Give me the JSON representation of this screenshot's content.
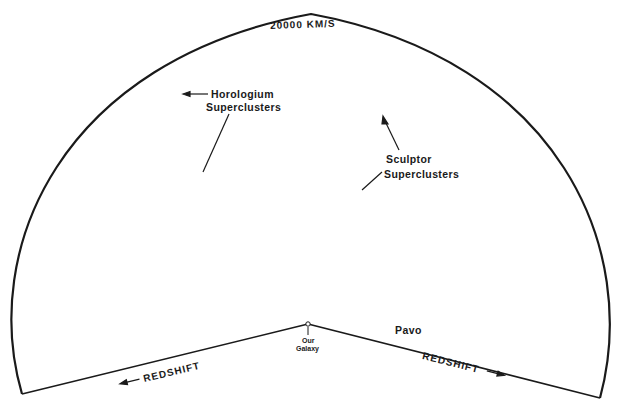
{
  "figure": {
    "colors": {
      "ink": "#1a1a1a",
      "background": "#ffffff"
    }
  },
  "labels": {
    "velocity_limit": "20000 KM/S",
    "horologium_line1": "Horologium",
    "horologium_line2": "Superclusters",
    "sculptor_line1": "Sculptor",
    "sculptor_line2": "Superclusters",
    "pavo": "Pavo",
    "our_galaxy_line1": "Our",
    "our_galaxy_line2": "Galaxy",
    "redshift_left": "REDSHIFT",
    "redshift_right": "REDSHIFT"
  },
  "geometry": {
    "apex": [
      308,
      324
    ],
    "left_corner": [
      22,
      394
    ],
    "right_corner": [
      600,
      398
    ],
    "arc_top": [
      311,
      14
    ]
  },
  "clusters": [
    {
      "name": "horologium-filament-a",
      "type": "line",
      "from": [
        100,
        70
      ],
      "to": [
        160,
        135
      ],
      "n": 40,
      "spread": 4
    },
    {
      "name": "horologium-filament-b",
      "type": "line",
      "from": [
        145,
        80
      ],
      "to": [
        175,
        130
      ],
      "n": 30,
      "spread": 4
    },
    {
      "name": "horologium-cloud",
      "type": "blob",
      "center": [
        140,
        105
      ],
      "r": [
        45,
        40
      ],
      "n": 55
    },
    {
      "name": "horologium-south",
      "type": "blob",
      "center": [
        200,
        185
      ],
      "r": [
        45,
        45
      ],
      "n": 95
    },
    {
      "name": "sculptor-filament",
      "type": "line",
      "from": [
        405,
        40
      ],
      "to": [
        370,
        135
      ],
      "n": 45,
      "spread": 5
    },
    {
      "name": "sculptor-cloud",
      "type": "blob",
      "center": [
        380,
        110
      ],
      "r": [
        25,
        40
      ],
      "n": 35
    },
    {
      "name": "central-wall",
      "type": "line",
      "from": [
        245,
        300
      ],
      "to": [
        340,
        190
      ],
      "n": 60,
      "spread": 9
    },
    {
      "name": "central-blob",
      "type": "blob",
      "center": [
        285,
        250
      ],
      "r": [
        55,
        40
      ],
      "n": 110
    },
    {
      "name": "galaxy-vicinity",
      "type": "blob",
      "center": [
        300,
        305
      ],
      "r": [
        22,
        14
      ],
      "n": 45
    },
    {
      "name": "pavo-cluster",
      "type": "blob",
      "center": [
        375,
        315
      ],
      "r": [
        30,
        16
      ],
      "n": 60
    },
    {
      "name": "east-wall",
      "type": "blob",
      "center": [
        390,
        240
      ],
      "r": [
        45,
        55
      ],
      "n": 90
    },
    {
      "name": "west-wall",
      "type": "line",
      "from": [
        60,
        285
      ],
      "to": [
        165,
        295
      ],
      "n": 30,
      "spread": 6
    },
    {
      "name": "mid-column",
      "type": "blob",
      "center": [
        320,
        120
      ],
      "r": [
        30,
        80
      ],
      "n": 60
    },
    {
      "name": "field-left",
      "type": "blob",
      "center": [
        170,
        260
      ],
      "r": [
        100,
        70
      ],
      "n": 90
    },
    {
      "name": "field-right",
      "type": "blob",
      "center": [
        480,
        230
      ],
      "r": [
        90,
        90
      ],
      "n": 55
    },
    {
      "name": "field-top",
      "type": "blob",
      "center": [
        300,
        70
      ],
      "r": [
        150,
        45
      ],
      "n": 50
    }
  ]
}
